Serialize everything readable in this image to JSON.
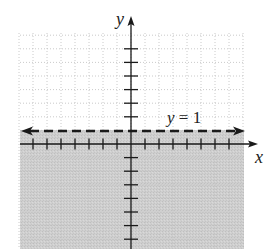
{
  "diagram": {
    "type": "inequality-graph",
    "axes": {
      "x_label": "x",
      "y_label": "y"
    },
    "boundary": {
      "equation_label": "y = 1",
      "style": "dashed",
      "arrows": "both-ends",
      "y_value": 1
    },
    "shading": {
      "region": "below boundary",
      "color": "#cdcdcd"
    },
    "grid": {
      "style": "dotted",
      "color": "#bdbdbd",
      "x_range": [
        -8,
        8
      ],
      "y_range": [
        -7,
        8
      ]
    },
    "ticks": {
      "x": [
        -7,
        -6,
        -5,
        -4,
        -3,
        -2,
        -1,
        1,
        2,
        3,
        4,
        5,
        6,
        7
      ],
      "y": [
        -7,
        -6,
        -5,
        -4,
        -3,
        -2,
        -1,
        2,
        3,
        4,
        5,
        6,
        7
      ]
    },
    "colors": {
      "axis": "#1a1a1a",
      "grid": "#bdbdbd",
      "shade": "#cdcdcd",
      "background": "#ffffff"
    }
  }
}
